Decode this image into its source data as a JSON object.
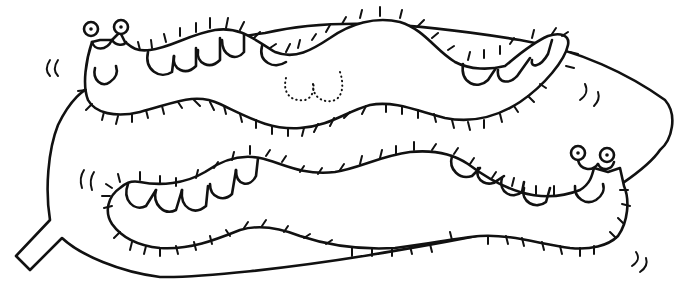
{
  "scene": {
    "title": "Two caterpillars on a leaf",
    "style": "black line art, white background",
    "colors": {
      "ink": "#111111",
      "background": "#ffffff"
    }
  },
  "elements": {
    "leaf": {
      "label": "leaf with stem at lower left"
    },
    "caterpillar_top": {
      "label": "smiling caterpillar facing left (top)",
      "eyes": 2,
      "feet_visible": 9,
      "feet_hidden_dotted": 2
    },
    "caterpillar_bottom": {
      "label": "smiling caterpillar facing right (bottom)",
      "eyes": 2,
      "feet_visible": 9
    },
    "motion_marks": {
      "label": "small motion strokes near heads and tail",
      "count": 4
    }
  }
}
